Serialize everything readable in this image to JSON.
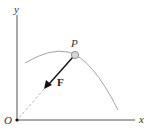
{
  "diagram": {
    "labels": {
      "y_axis": "y",
      "x_axis": "x",
      "origin": "O",
      "point": "P",
      "force": "F"
    },
    "colors": {
      "axis": "#555555",
      "curve": "#9a9a9a",
      "arrow": "#111111",
      "dashed": "#b0b0b0",
      "particle_fill": "#d8d8d8"
    }
  }
}
